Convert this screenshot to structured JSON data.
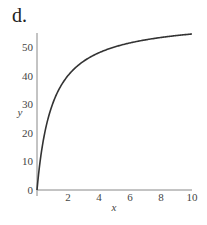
{
  "panel_label": "d.",
  "chart_data": {
    "type": "line",
    "title": "",
    "xlabel": "x",
    "ylabel": "y",
    "xlim": [
      0,
      10
    ],
    "ylim": [
      0,
      55
    ],
    "xticks": [
      2,
      4,
      6,
      8,
      10
    ],
    "yticks": [
      0,
      10,
      20,
      30,
      40,
      50
    ],
    "grid": false,
    "legend": null,
    "series": [
      {
        "name": "y",
        "color": "#333333",
        "x": [
          0,
          0.25,
          0.5,
          1,
          1.5,
          2,
          3,
          4,
          5,
          6,
          7,
          8,
          9,
          10
        ],
        "y": [
          0,
          12,
          20,
          30,
          36,
          40,
          45,
          48,
          50,
          51.4,
          52.5,
          53.3,
          54,
          54.5
        ]
      }
    ]
  }
}
